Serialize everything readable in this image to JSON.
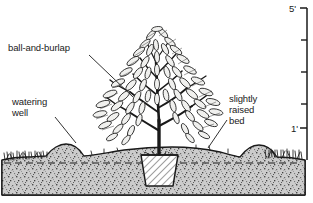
{
  "diagram": {
    "type": "cross-section-illustration",
    "style": "black-and-white line drawing with stippled soil",
    "background_color": "#ffffff",
    "ink_color": "#1a1a1a"
  },
  "labels": {
    "ball_and_burlap": "ball-and-burlap",
    "watering_well_line1": "watering",
    "watering_well_line2": "well",
    "raised_bed_line1": "slightly",
    "raised_bed_line2": "raised",
    "raised_bed_line3": "bed"
  },
  "scale": {
    "orientation": "vertical",
    "position": "right-edge",
    "top_label": "5'",
    "lower_label": "1'",
    "tick_count": 5,
    "unit": "feet"
  },
  "elements": {
    "plant": "deciduous shrub with multiple upright branches and lanceolate leaves",
    "root_ball": "trapezoidal burlapped root ball, diagonal hatching",
    "soil": "stippled earth mass below grade",
    "grade_line": "dashed horizontal line at original grade",
    "mounds": "two low mounds forming the watering well berm",
    "grass": "short grass tufts at left and right ground surface"
  },
  "colors": {
    "ink": "#1a1a1a",
    "soil_fill": "#c9c9c9",
    "soil_dots": "#555555",
    "ball_fill": "#ffffff",
    "paper": "#ffffff"
  }
}
